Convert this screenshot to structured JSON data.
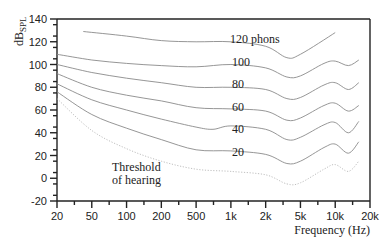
{
  "chart_data": {
    "type": "line",
    "title": "",
    "xlabel": "Frequency (Hz)",
    "ylabel": "dB_SPL",
    "ylabel_main": "dB",
    "ylabel_sub": "SPL",
    "x_scale": "log",
    "x_ticks": [
      "20",
      "50",
      "100",
      "200",
      "500",
      "1k",
      "2k",
      "5k",
      "10k",
      "20k"
    ],
    "x_tick_values": [
      20,
      50,
      100,
      200,
      500,
      1000,
      2000,
      5000,
      10000,
      20000
    ],
    "y_ticks": [
      "140",
      "120",
      "100",
      "80",
      "60",
      "40",
      "20",
      "0",
      "-20"
    ],
    "ylim": [
      -20,
      140
    ],
    "xlim": [
      20,
      20000
    ],
    "grid": false,
    "legend": "none (curves labeled inline)",
    "series": [
      {
        "name": "120 phons",
        "label": "120 phons",
        "style": "solid",
        "x": [
          40,
          100,
          200,
          500,
          1000,
          2000,
          3500,
          5000,
          10000
        ],
        "y": [
          129,
          125,
          121,
          120,
          120,
          116,
          106,
          109,
          128
        ]
      },
      {
        "name": "100 phons",
        "label": "100",
        "style": "solid",
        "x": [
          20,
          50,
          100,
          200,
          500,
          1000,
          2000,
          3500,
          5000,
          8000,
          10000,
          13000,
          16000
        ],
        "y": [
          109,
          104,
          101,
          99,
          98,
          100,
          97,
          89,
          90,
          101,
          103,
          99,
          104
        ]
      },
      {
        "name": "80 phons",
        "label": "80",
        "style": "solid",
        "x": [
          20,
          50,
          100,
          200,
          500,
          1000,
          2000,
          3500,
          5000,
          8000,
          10000,
          13000,
          16000
        ],
        "y": [
          100,
          93,
          88,
          84,
          80,
          80,
          78,
          70,
          71,
          82,
          84,
          78,
          84
        ]
      },
      {
        "name": "60 phons",
        "label": "60",
        "style": "solid",
        "x": [
          20,
          50,
          100,
          200,
          500,
          1000,
          2000,
          3500,
          5000,
          8000,
          10000,
          13000,
          16000
        ],
        "y": [
          92,
          80,
          73,
          68,
          62,
          61,
          59,
          51,
          53,
          64,
          66,
          59,
          64
        ]
      },
      {
        "name": "40 phons",
        "label": "40",
        "style": "solid",
        "x": [
          20,
          50,
          100,
          200,
          500,
          700,
          1000,
          2000,
          3500,
          5000,
          8000,
          10000,
          13000,
          16000
        ],
        "y": [
          83,
          69,
          60,
          52,
          45,
          43,
          46,
          43,
          34,
          36,
          47,
          49,
          40,
          50
        ]
      },
      {
        "name": "20 phons",
        "label": "20",
        "style": "solid",
        "x": [
          20,
          50,
          100,
          200,
          500,
          1000,
          2000,
          3500,
          5000,
          8000,
          10000,
          13000,
          16000
        ],
        "y": [
          76,
          56,
          44,
          34,
          25,
          24,
          21,
          13,
          15,
          27,
          30,
          22,
          32
        ]
      },
      {
        "name": "Threshold of hearing",
        "label": "Threshold of hearing",
        "style": "dotted",
        "x": [
          20,
          50,
          100,
          200,
          500,
          1000,
          2000,
          3500,
          5000,
          8000,
          10000,
          13000,
          16000
        ],
        "y": [
          70,
          42,
          26,
          15,
          8,
          6,
          3,
          -5,
          -4,
          8,
          12,
          6,
          15
        ]
      }
    ]
  },
  "colors": {
    "axis": "#222222",
    "curve": "#8a8a8a",
    "threshold": "#b8b8b8",
    "background": "#ffffff"
  },
  "labels": {
    "phon_120": "120 phons",
    "phon_100": "100",
    "phon_80": "80",
    "phon_60": "60",
    "phon_40": "40",
    "phon_20": "20",
    "threshold_line1": "Threshold",
    "threshold_line2": "of hearing"
  }
}
